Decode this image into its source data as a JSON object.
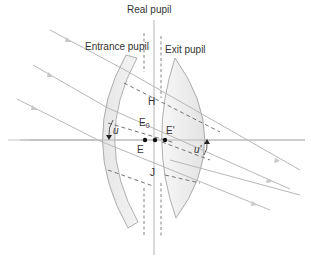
{
  "diagram": {
    "title": "Real pupil",
    "labels": {
      "real_pupil": "Real pupil",
      "entrance_pupil": "Entrance pupil",
      "exit_pupil": "Exit pupil",
      "point_H": "H",
      "point_J": "J",
      "point_E": "E",
      "point_E0": "E",
      "point_E0_sub": "0",
      "point_E_prime": "E'",
      "angle_u": "u",
      "angle_u_prime": "u'"
    },
    "colors": {
      "ray": "#b8b8b8",
      "lens_fill": "#ececec",
      "lens_stroke": "#9a9a9a",
      "dashed": "#777777",
      "text": "#333333",
      "point": "#111111"
    }
  }
}
